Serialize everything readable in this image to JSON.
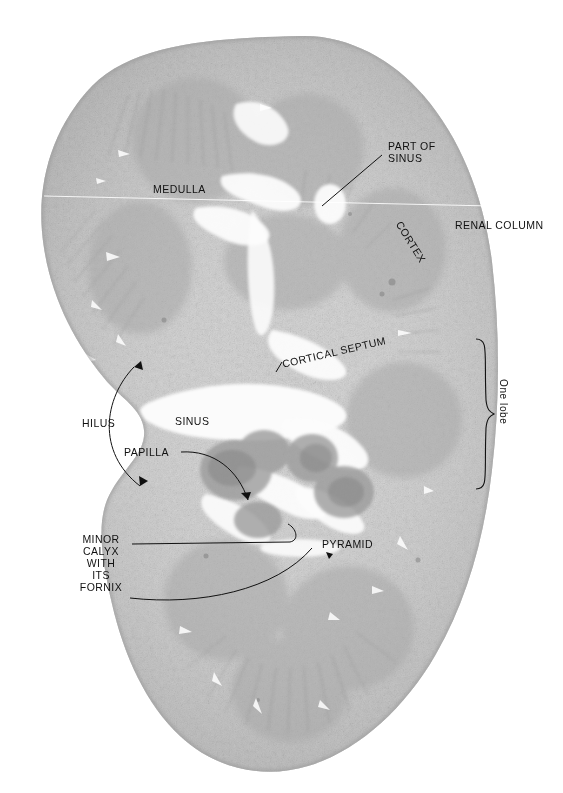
{
  "figure": {
    "kind": "histological-section",
    "organ": "kidney",
    "plane": "coronal",
    "background_color": "#ffffff",
    "tissue_color_light": "#d6d6d6",
    "tissue_color_mid": "#bdbdbd",
    "tissue_color_dark": "#9a9a9a",
    "ink_color": "#111111"
  },
  "labels": {
    "medulla": "MEDULLA",
    "part_of_sinus": "PART OF\nSINUS",
    "renal_column": "RENAL COLUMN",
    "cortex": "CORTEX",
    "cortical_septum": "CORTICAL SEPTUM",
    "one_lobe": "One lobe",
    "hilus": "HILUS",
    "sinus": "SINUS",
    "papilla": "PAPILLA",
    "pyramid": "PYRAMID",
    "minor_calyx": "MINOR\nCALYX\nWITH\nITS\nFORNIX"
  }
}
